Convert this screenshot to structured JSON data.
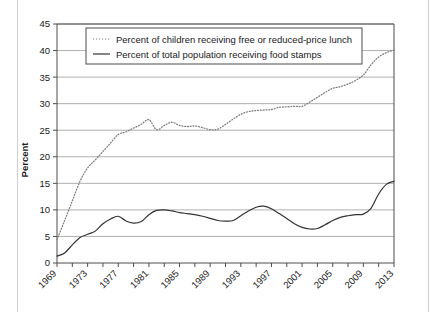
{
  "figure": {
    "name": "line-chart-figure",
    "background": "#ffffff"
  },
  "chart_data": {
    "type": "line",
    "title": "",
    "xlabel": "",
    "ylabel": "Percent",
    "xlim": [
      1969,
      2013
    ],
    "ylim": [
      0,
      45
    ],
    "grid": true,
    "grid_axis": "y",
    "legend_position": "top-center-inside",
    "ytick_values": [
      0,
      5,
      10,
      15,
      20,
      25,
      30,
      35,
      40,
      45
    ],
    "ytick_labels": [
      "0",
      "5",
      "10",
      "15",
      "20",
      "25",
      "30",
      "35",
      "40",
      "45"
    ],
    "xtick_values": [
      1969,
      1973,
      1977,
      1981,
      1985,
      1989,
      1993,
      1997,
      2001,
      2005,
      2009,
      2013
    ],
    "xtick_labels": [
      "1969",
      "1973",
      "1977",
      "1981",
      "1985",
      "1989",
      "1993",
      "1997",
      "2001",
      "2005",
      "2009",
      "2013"
    ],
    "xtick_minor_step": 2,
    "x": [
      1969,
      1970,
      1971,
      1972,
      1973,
      1974,
      1975,
      1976,
      1977,
      1978,
      1979,
      1980,
      1981,
      1982,
      1983,
      1984,
      1985,
      1986,
      1987,
      1988,
      1989,
      1990,
      1991,
      1992,
      1993,
      1994,
      1995,
      1996,
      1997,
      1998,
      1999,
      2000,
      2001,
      2002,
      2003,
      2004,
      2005,
      2006,
      2007,
      2008,
      2009,
      2010,
      2011,
      2012,
      2013
    ],
    "series": [
      {
        "name": "Percent of children receiving free or reduced-price lunch",
        "style": "dotted",
        "color": "#808080",
        "values": [
          4.4,
          8.0,
          11.7,
          15.4,
          17.9,
          19.4,
          21.0,
          22.6,
          24.2,
          24.7,
          25.4,
          26.1,
          27.0,
          25.1,
          25.9,
          26.5,
          25.9,
          25.7,
          25.8,
          25.5,
          25.1,
          25.2,
          26.1,
          27.1,
          28.0,
          28.5,
          28.7,
          28.8,
          28.9,
          29.3,
          29.4,
          29.5,
          29.5,
          30.3,
          31.2,
          32.1,
          32.9,
          33.2,
          33.7,
          34.4,
          35.4,
          37.3,
          38.8,
          39.6,
          40.1
        ]
      },
      {
        "name": "Percent of total population receiving food stamps",
        "style": "solid",
        "color": "#333333",
        "values": [
          1.3,
          1.9,
          3.4,
          4.8,
          5.4,
          6.0,
          7.4,
          8.3,
          8.8,
          7.9,
          7.5,
          7.8,
          9.1,
          9.9,
          10.0,
          9.8,
          9.5,
          9.3,
          9.1,
          8.8,
          8.4,
          8.0,
          7.9,
          8.0,
          8.9,
          9.8,
          10.5,
          10.7,
          10.2,
          9.3,
          8.4,
          7.4,
          6.7,
          6.4,
          6.5,
          7.2,
          8.0,
          8.6,
          8.9,
          9.1,
          9.2,
          10.3,
          13.0,
          14.8,
          15.4
        ]
      }
    ]
  },
  "legend": {
    "items": [
      {
        "marker": "dotted-line-swatch",
        "label": "Percent of children receiving free or reduced-price lunch"
      },
      {
        "marker": "solid-line-swatch",
        "label": "Percent of total population receiving food stamps"
      }
    ]
  },
  "axis": {
    "y_title": "Percent"
  }
}
